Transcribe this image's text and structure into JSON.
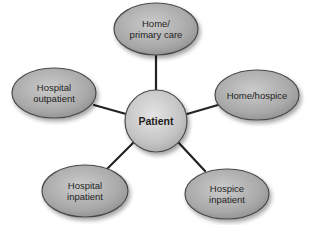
{
  "diagram": {
    "type": "hub-and-spoke",
    "colors": {
      "background": "#ffffff",
      "ellipse_fill_light": "#c9c9c9",
      "ellipse_fill_dark": "#9c9c9c",
      "center_fill_light": "#e2e2e2",
      "center_fill_dark": "#b8b8b8",
      "border": "#4a4a4a",
      "connector": "#222222",
      "text": "#1e1e1e"
    },
    "center": {
      "label": "Patient"
    },
    "nodes": [
      {
        "id": "home-primary-care",
        "label": "Home/\nprimary care"
      },
      {
        "id": "home-hospice",
        "label": "Home/hospice"
      },
      {
        "id": "hospice-inpatient",
        "label": "Hospice\ninpatient"
      },
      {
        "id": "hospital-inpatient",
        "label": "Hospital\ninpatient"
      },
      {
        "id": "hospital-outpatient",
        "label": "Hospital\noutpatient"
      }
    ]
  }
}
